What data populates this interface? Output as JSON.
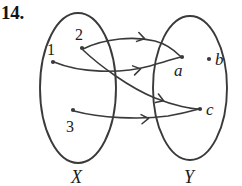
{
  "figure": {
    "problem_number": "14.",
    "type": "function-arrow-diagram",
    "ink_color": "#3a3a3a",
    "text_color": "#1b1b1b",
    "background": "#ffffff",
    "domain_set": {
      "name": "X",
      "label": "X",
      "ellipse": {
        "cx": 78,
        "cy": 88,
        "rx": 38,
        "ry": 75
      },
      "label_pos": {
        "x": 71,
        "y": 168
      },
      "elements": [
        {
          "id": "1",
          "label": "1",
          "dot": {
            "x": 53,
            "y": 62
          },
          "label_pos": {
            "x": 47,
            "y": 42
          }
        },
        {
          "id": "2",
          "label": "2",
          "dot": {
            "x": 82,
            "y": 48
          },
          "label_pos": {
            "x": 75,
            "y": 27
          }
        },
        {
          "id": "3",
          "label": "3",
          "dot": {
            "x": 73,
            "y": 110
          },
          "label_pos": {
            "x": 66,
            "y": 119
          }
        }
      ]
    },
    "codomain_set": {
      "name": "Y",
      "label": "Y",
      "ellipse": {
        "cx": 190,
        "cy": 88,
        "rx": 37,
        "ry": 72
      },
      "label_pos": {
        "x": 184,
        "y": 168
      },
      "elements": [
        {
          "id": "a",
          "label": "a",
          "dot": {
            "x": 182,
            "y": 57
          },
          "label_pos": {
            "x": 174,
            "y": 62
          }
        },
        {
          "id": "b",
          "label": "b",
          "dot": {
            "x": 209,
            "y": 59
          },
          "label_pos": {
            "x": 215,
            "y": 51
          }
        },
        {
          "id": "c",
          "label": "c",
          "dot": {
            "x": 200,
            "y": 109
          },
          "label_pos": {
            "x": 206,
            "y": 101
          }
        }
      ]
    },
    "arrows": [
      {
        "id": "arrow-1-a",
        "from": "1",
        "to": "a",
        "path": "M 54 62 C 80 73, 120 74, 150 66 C 165 62, 175 58, 181 57",
        "arrowhead": {
          "x": 140,
          "y": 69,
          "angle": -12
        }
      },
      {
        "id": "arrow-2-a",
        "from": "2",
        "to": "a",
        "path": "M 83 49 C 105 38, 135 36, 155 41 C 170 45, 177 53, 181 57",
        "arrowhead": {
          "x": 144,
          "y": 38.5,
          "angle": 14
        }
      },
      {
        "id": "arrow-2-c",
        "from": "2",
        "to": "c",
        "path": "M 83 50 C 100 66, 130 88, 155 98 C 175 106, 192 109, 199 109",
        "arrowhead": {
          "x": 163,
          "y": 100.5,
          "angle": 20
        }
      },
      {
        "id": "arrow-3-c",
        "from": "3",
        "to": "c",
        "path": "M 74 111 C 100 118, 140 120, 168 116 C 186 113, 195 110, 199 109",
        "arrowhead": {
          "x": 148,
          "y": 118.5,
          "angle": -6
        }
      }
    ]
  }
}
